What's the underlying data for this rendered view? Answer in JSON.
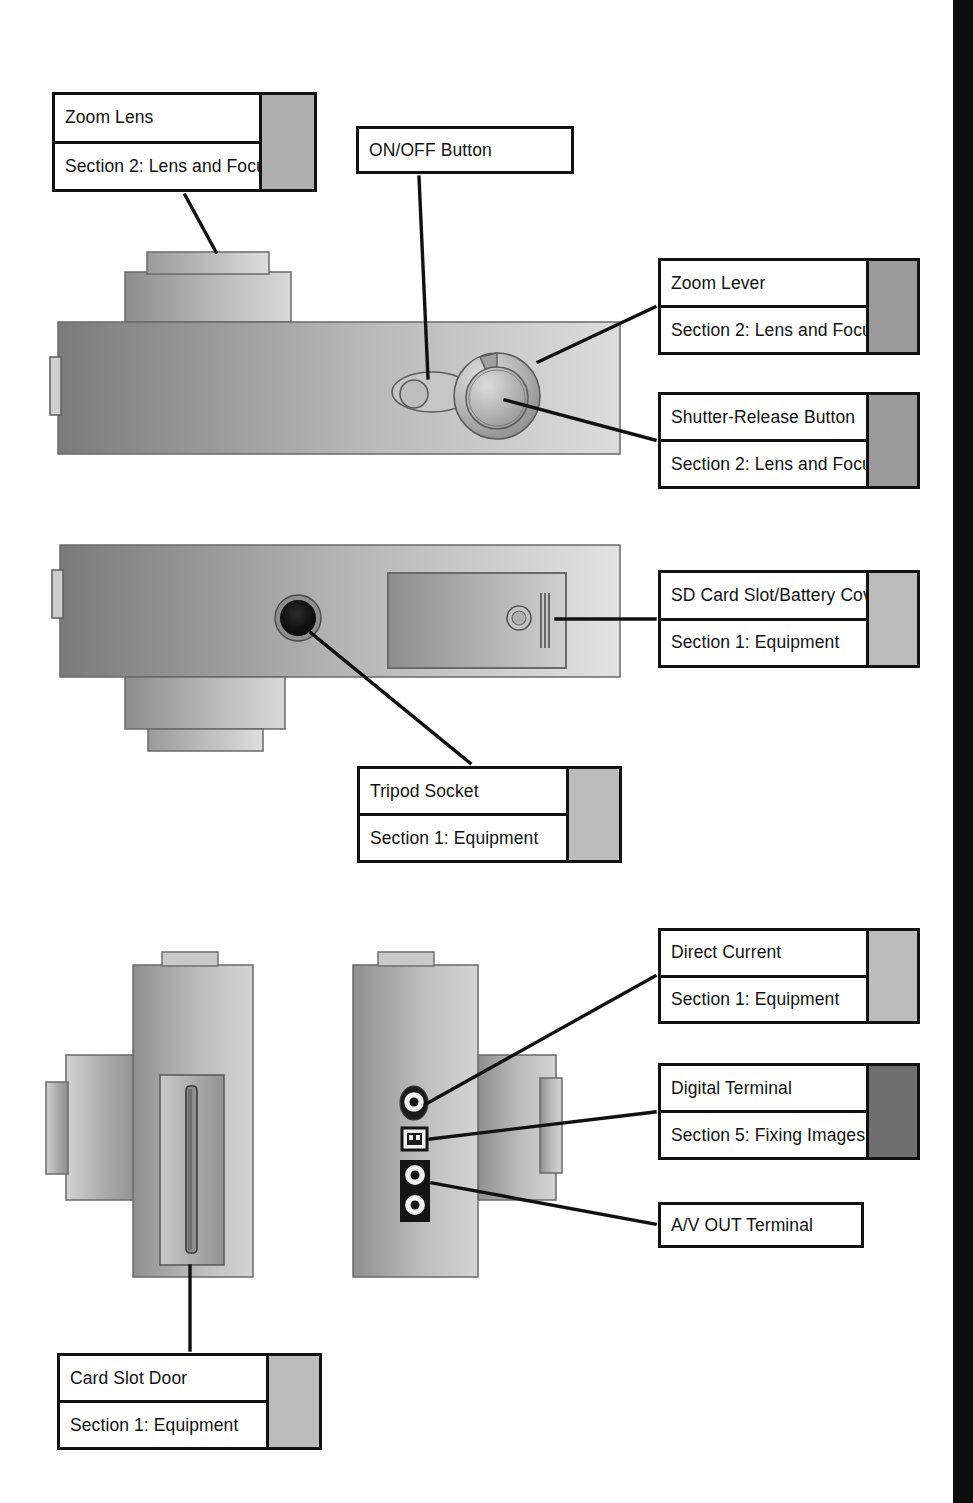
{
  "page": {
    "width": 973,
    "height": 1503,
    "background": "#ffffff",
    "edge_strip_color": "#0d0d0d"
  },
  "colors": {
    "line": "#111111",
    "swatch_light": "#b5b5b5",
    "swatch_mid": "#9a9a9a",
    "swatch_dark": "#6e6e6e",
    "body_dark": "#7d7d7d",
    "body_light": "#d6d6d6",
    "terminal_dark": "#141414"
  },
  "callouts": [
    {
      "id": "zoom-lens",
      "title": "Zoom Lens",
      "section": "Section 2: Lens and Focusing",
      "swatch": "#b0b0b0",
      "has_swatch": true,
      "x": 52,
      "y": 92,
      "w": 265,
      "h": 100,
      "swatch_w": 52
    },
    {
      "id": "on-off-button",
      "title": "ON/OFF Button",
      "section": "",
      "swatch": "",
      "has_swatch": false,
      "x": 356,
      "y": 126,
      "w": 218,
      "h": 48,
      "swatch_w": 0
    },
    {
      "id": "zoom-lever",
      "title": "Zoom Lever",
      "section": "Section 2: Lens and Focusing",
      "swatch": "#9a9a9a",
      "has_swatch": true,
      "x": 658,
      "y": 258,
      "w": 262,
      "h": 97,
      "swatch_w": 48
    },
    {
      "id": "shutter-release-button",
      "title": "Shutter-Release Button",
      "section": "Section 2: Lens and Focusing",
      "swatch": "#9a9a9a",
      "has_swatch": true,
      "x": 658,
      "y": 392,
      "w": 262,
      "h": 97,
      "swatch_w": 48
    },
    {
      "id": "sd-card-slot-battery-cover",
      "title": "SD Card Slot/Battery Cover",
      "section": "Section 1: Equipment",
      "swatch": "#bcbcbc",
      "has_swatch": true,
      "x": 658,
      "y": 570,
      "w": 262,
      "h": 98,
      "swatch_w": 48
    },
    {
      "id": "tripod-socket",
      "title": "Tripod Socket",
      "section": "Section 1: Equipment",
      "swatch": "#bcbcbc",
      "has_swatch": true,
      "x": 357,
      "y": 766,
      "w": 265,
      "h": 97,
      "swatch_w": 50
    },
    {
      "id": "direct-current",
      "title": "Direct Current",
      "section": "Section 1: Equipment",
      "swatch": "#bcbcbc",
      "has_swatch": true,
      "x": 658,
      "y": 928,
      "w": 262,
      "h": 96,
      "swatch_w": 48
    },
    {
      "id": "digital-terminal",
      "title": "Digital Terminal",
      "section": "Section 5: Fixing Images",
      "swatch": "#6e6e6e",
      "has_swatch": true,
      "x": 658,
      "y": 1063,
      "w": 262,
      "h": 97,
      "swatch_w": 48
    },
    {
      "id": "av-out-terminal",
      "title": "A/V OUT Terminal",
      "section": "",
      "swatch": "",
      "has_swatch": false,
      "x": 658,
      "y": 1202,
      "w": 206,
      "h": 46,
      "swatch_w": 0
    },
    {
      "id": "card-slot-door",
      "title": "Card Slot Door",
      "section": "Section 1: Equipment",
      "swatch": "#bcbcbc",
      "has_swatch": true,
      "x": 57,
      "y": 1353,
      "w": 265,
      "h": 97,
      "swatch_w": 50
    }
  ],
  "views": [
    {
      "id": "top-view",
      "label": "camera-top-view",
      "parts": [
        "zoom-lens-barrel",
        "camera-body-top",
        "on-off-button",
        "zoom-lever-ring",
        "shutter-release-button",
        "strap-lug"
      ]
    },
    {
      "id": "bottom-view",
      "label": "camera-bottom-view",
      "parts": [
        "camera-body-bottom",
        "tripod-socket",
        "sd-card-battery-cover",
        "cover-latch",
        "lens-barrel-bottom"
      ]
    },
    {
      "id": "left-side-view",
      "label": "camera-left-side-view",
      "parts": [
        "camera-body-left",
        "card-slot-door",
        "lens-barrel-left"
      ]
    },
    {
      "id": "right-side-view",
      "label": "camera-right-side-view",
      "parts": [
        "camera-body-right",
        "dc-in-terminal",
        "digital-terminal",
        "av-out-terminal",
        "lens-barrel-right"
      ]
    }
  ]
}
